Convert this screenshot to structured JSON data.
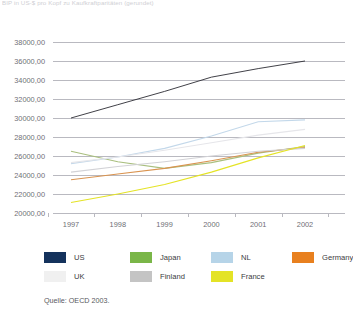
{
  "figure": {
    "title_clipped": "BIP in US-$ pro Kopf zu Kaufkraftparitäten (gerundet)",
    "source": "Quelle: OECD 2003."
  },
  "legend": {
    "rows": [
      [
        {
          "label": "US",
          "color": "#14325c"
        },
        {
          "label": "Japan",
          "color": "#7ab648"
        },
        {
          "label": "NL",
          "color": "#b6d4e8"
        },
        {
          "label": "Germany",
          "color": "#e8801f"
        }
      ],
      [
        {
          "label": "UK",
          "color": "#f0f0f0"
        },
        {
          "label": "Finland",
          "color": "#c4c4c4"
        },
        {
          "label": "France",
          "color": "#e4e326"
        }
      ]
    ]
  },
  "chart_data": {
    "type": "line",
    "title": "BIP in US-$ pro Kopf zu Kaufkraftparitäten (gerundet)",
    "xlabel": "",
    "ylabel": "",
    "categories": [
      "1997",
      "1998",
      "1999",
      "2000",
      "2001",
      "2002"
    ],
    "x": [
      1997,
      1998,
      1999,
      2000,
      2001,
      2002
    ],
    "ylim": [
      20000,
      38000
    ],
    "ytick_step": 2000,
    "ytick_labels": [
      "38000,00",
      "36000,00",
      "34000,00",
      "32000,00",
      "30000,00",
      "28000,00",
      "26000,00",
      "24000,00",
      "22000,00",
      "20000,00"
    ],
    "ytick_values": [
      38000,
      36000,
      34000,
      32000,
      30000,
      28000,
      26000,
      24000,
      22000,
      20000
    ],
    "grid": true,
    "legend_position": "bottom",
    "series": [
      {
        "name": "US",
        "color": "#2b2b33",
        "values": [
          30000,
          31400,
          32800,
          34300,
          35200,
          36000
        ]
      },
      {
        "name": "Japan",
        "color": "#a9bf7e",
        "values": [
          26500,
          25400,
          24700,
          25300,
          26300,
          27000
        ]
      },
      {
        "name": "NL",
        "color": "#c3d8ea",
        "values": [
          25200,
          25900,
          26800,
          28100,
          29600,
          29800
        ]
      },
      {
        "name": "Germany",
        "color": "#d9934f",
        "values": [
          23500,
          24100,
          24700,
          25500,
          26400,
          26900
        ]
      },
      {
        "name": "UK",
        "color": "#e6e6ea",
        "values": [
          25300,
          25900,
          26600,
          27400,
          28200,
          28800
        ]
      },
      {
        "name": "Finland",
        "color": "#d2d2d6",
        "values": [
          24300,
          24900,
          25400,
          26000,
          26500,
          26800
        ]
      },
      {
        "name": "France",
        "color": "#e4e326",
        "values": [
          21100,
          22000,
          23000,
          24300,
          25800,
          27100
        ]
      }
    ]
  }
}
